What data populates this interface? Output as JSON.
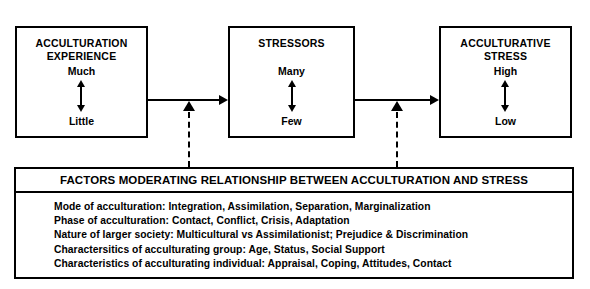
{
  "diagram": {
    "boxes": [
      {
        "title": "ACCULTURATION\nEXPERIENCE",
        "high_pole": "Much",
        "low_pole": "Little"
      },
      {
        "title": "STRESSORS",
        "high_pole": "Many",
        "low_pole": "Few"
      },
      {
        "title": "ACCULTURATIVE\nSTRESS",
        "high_pole": "High",
        "low_pole": "Low"
      }
    ],
    "panel": {
      "header": "FACTORS MODERATING RELATIONSHIP BETWEEN ACCULTURATION AND STRESS",
      "lines": [
        "Mode of acculturation: Integration, Assimilation, Separation, Marginalization",
        "Phase of acculturation: Contact, Conflict, Crisis, Adaptation",
        "Nature of larger society: Multicultural vs Assimilationist; Prejudice & Discrimination",
        "Charactersitics of acculturating group: Age, Status, Social Support",
        "Characteristics of acculturating individual: Appraisal, Coping, Attitudes, Contact"
      ]
    },
    "colors": {
      "stroke": "#000000",
      "background": "#ffffff"
    }
  }
}
